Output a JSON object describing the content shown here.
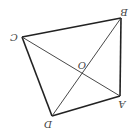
{
  "diagram": {
    "type": "quadrilateral-with-diagonals",
    "orientation": "rotated-180",
    "points": {
      "A": {
        "label": "A",
        "x": 120,
        "y": 96,
        "lx": 122,
        "ly": 104
      },
      "B": {
        "label": "B",
        "x": 121,
        "y": 18,
        "lx": 124,
        "ly": 12
      },
      "C": {
        "label": "C",
        "x": 22,
        "y": 37,
        "lx": 14,
        "ly": 37
      },
      "D": {
        "label": "D",
        "x": 52,
        "y": 116,
        "lx": 48,
        "ly": 124
      },
      "O": {
        "label": "O",
        "x": 82,
        "y": 72,
        "lx": 82,
        "ly": 65
      }
    },
    "edges": [
      [
        "B",
        "C"
      ],
      [
        "C",
        "D"
      ],
      [
        "D",
        "A"
      ],
      [
        "A",
        "B"
      ]
    ],
    "diagonals": [
      [
        "C",
        "A"
      ],
      [
        "D",
        "B"
      ]
    ],
    "colors": {
      "edge": "#222222",
      "diagonal": "#333333",
      "label": "#444444"
    }
  }
}
